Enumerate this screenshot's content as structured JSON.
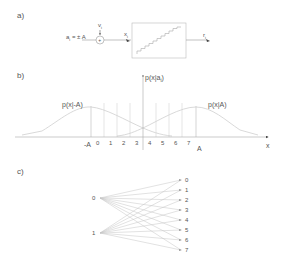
{
  "panel_a": {
    "label": "a)",
    "input_label": "a",
    "input_sub": "i",
    "input_value": " = ± A",
    "noise_label": "v",
    "noise_sub": "i",
    "sum_symbol": "+",
    "x_label": "x",
    "x_sub": "i",
    "output_label": "r",
    "output_sub": "i",
    "block": "quantizer"
  },
  "panel_b": {
    "label": "b)",
    "y_axis_label": "p(x|a",
    "y_axis_sub": "i",
    "y_axis_close": ")",
    "left_curve_label": "p(x|-A)",
    "right_curve_label": "p(x|A)",
    "x_axis_label": "x",
    "neg_A": "-A",
    "pos_A": "A",
    "ticks": [
      "0",
      "1",
      "2",
      "3",
      "4",
      "5",
      "6",
      "7"
    ]
  },
  "panel_c": {
    "label": "c)",
    "inputs": [
      "0",
      "1"
    ],
    "outputs": [
      "0",
      "1",
      "2",
      "3",
      "4",
      "5",
      "6",
      "7"
    ]
  },
  "colors": {
    "line": "#9a9a9a",
    "curve": "#c8c8c8",
    "text": "#555555"
  }
}
